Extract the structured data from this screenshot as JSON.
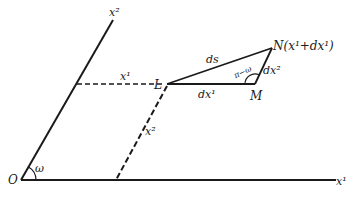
{
  "diagram": {
    "colors": {
      "ink": "#1a1a1a",
      "background": "#ffffff"
    },
    "points": {
      "origin": {
        "label": "O"
      },
      "L": {
        "label": "L"
      },
      "M": {
        "label": "M"
      },
      "N": {
        "label": "N(x¹+dx¹)"
      }
    },
    "axes": {
      "x1": {
        "label": "x¹"
      },
      "x2": {
        "label": "x²"
      }
    },
    "projections": {
      "to_x2_axis": {
        "label": "x¹"
      },
      "to_x1_axis": {
        "label": "x²"
      }
    },
    "segments": {
      "LM": {
        "label": "dx¹"
      },
      "MN": {
        "label": "dx²"
      },
      "LN": {
        "label": "ds"
      }
    },
    "angles": {
      "at_origin": {
        "label": "ω"
      },
      "at_M": {
        "label": "π−ω"
      }
    }
  }
}
